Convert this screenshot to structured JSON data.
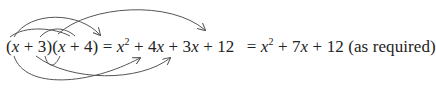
{
  "diagram": {
    "type": "FOIL expansion with curved arrows",
    "expression": {
      "factor1": {
        "open": "(",
        "var": "x",
        "op": " + ",
        "const": "3",
        "close": ")"
      },
      "factor2": {
        "open": "(",
        "var": "x",
        "op": " + ",
        "const": "4",
        "close": ")"
      },
      "eq1": " = ",
      "expansion": {
        "t1_var": "x",
        "t1_exp": "2",
        "op1": " + ",
        "t2": "4",
        "t2_var": "x",
        "op2": " + ",
        "t3": "3",
        "t3_var": "x",
        "op3": " + ",
        "t4": "12"
      },
      "eq2": " = ",
      "simplified": {
        "t1_var": "x",
        "t1_exp": "2",
        "op1": " + ",
        "t2": "7",
        "t2_var": "x",
        "op2": " + ",
        "t3": "12"
      },
      "note": " (as required)"
    },
    "arrows": [
      {
        "from": "x (factor1)",
        "to": "x²",
        "label": "first"
      },
      {
        "from": "x (factor1)",
        "to": "4x",
        "label": "outer"
      },
      {
        "from": "3 (factor1)",
        "to": "3x",
        "label": "inner"
      },
      {
        "from": "3 (factor1)",
        "to": "12",
        "label": "last"
      }
    ],
    "stroke_color": "#555555",
    "text_color": "#222222"
  }
}
